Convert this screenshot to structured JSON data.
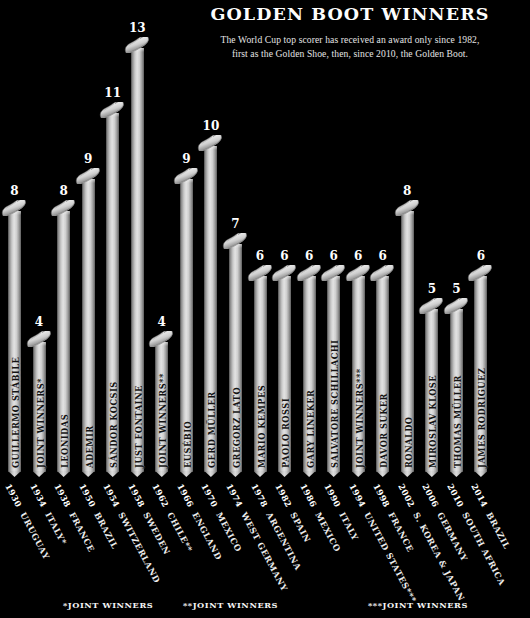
{
  "header": {
    "title": "GOLDEN BOOT WINNERS",
    "subtitle_line1": "The World Cup top scorer has received an award only since 1982,",
    "subtitle_line2": "first as the Golden Shoe, then, since 2010, the Golden Boot."
  },
  "footnotes": [
    {
      "label": "*JOINT WINNERS"
    },
    {
      "label": "**JOINT WINNERS"
    },
    {
      "label": "***JOINT WINNERS"
    }
  ],
  "colors": {
    "background": "#000000",
    "bar_light": "#e3e3e3",
    "bar_mid": "#9a9a9a",
    "bar_dark": "#4d4d4d",
    "text": "#ffffff",
    "bar_label_text": "#141414"
  },
  "chart_data": {
    "type": "bar",
    "title": "GOLDEN BOOT WINNERS",
    "subtitle": "The World Cup top scorer has received an award only since 1982, first as the Golden Shoe, then, since 2010, the Golden Boot.",
    "xlabel": "",
    "ylabel": "Goals",
    "ylim": [
      0,
      13
    ],
    "grid": false,
    "legend": "none",
    "categories": [
      "1930",
      "1934",
      "1938",
      "1950",
      "1954",
      "1958",
      "1962",
      "1966",
      "1970",
      "1974",
      "1978",
      "1982",
      "1986",
      "1990",
      "1994",
      "1998",
      "2002",
      "2006",
      "2010",
      "2014"
    ],
    "values": [
      8,
      4,
      8,
      9,
      11,
      13,
      4,
      9,
      10,
      7,
      6,
      6,
      6,
      6,
      6,
      6,
      8,
      5,
      5,
      6
    ],
    "bars": [
      {
        "year": "1930",
        "host": "URUGUAY",
        "scorer": "GUILLERMO STÁBILE",
        "goals": 8
      },
      {
        "year": "1934",
        "host": "ITALY*",
        "scorer": "JOINT WINNERS*",
        "goals": 4
      },
      {
        "year": "1938",
        "host": "FRANCE",
        "scorer": "LEONIDAS",
        "goals": 8
      },
      {
        "year": "1950",
        "host": "BRAZIL",
        "scorer": "ADEMIR",
        "goals": 9
      },
      {
        "year": "1954",
        "host": "SWITZERLAND",
        "scorer": "SÁNDOR KOCSIS",
        "goals": 11
      },
      {
        "year": "1958",
        "host": "SWEDEN",
        "scorer": "JUST FONTAINE",
        "goals": 13
      },
      {
        "year": "1962",
        "host": "CHILE**",
        "scorer": "JOINT WINNERS**",
        "goals": 4
      },
      {
        "year": "1966",
        "host": "ENGLAND",
        "scorer": "EUSÉBIO",
        "goals": 9
      },
      {
        "year": "1970",
        "host": "MEXICO",
        "scorer": "GERD MÜLLER",
        "goals": 10
      },
      {
        "year": "1974",
        "host": "WEST GERMANY",
        "scorer": "GREGORZ LATO",
        "goals": 7
      },
      {
        "year": "1978",
        "host": "ARGENTINA",
        "scorer": "MARIO KEMPES",
        "goals": 6
      },
      {
        "year": "1982",
        "host": "SPAIN",
        "scorer": "PAOLO ROSSI",
        "goals": 6
      },
      {
        "year": "1986",
        "host": "MEXICO",
        "scorer": "GARY LINEKER",
        "goals": 6
      },
      {
        "year": "1990",
        "host": "ITALY",
        "scorer": "SALVATORE SCHILLACHI",
        "goals": 6
      },
      {
        "year": "1994",
        "host": "UNITED STATES***",
        "scorer": "JOINT WINNERS***",
        "goals": 6
      },
      {
        "year": "1998",
        "host": "FRANCE",
        "scorer": "DAVOR SUKER",
        "goals": 6
      },
      {
        "year": "2002",
        "host": "S. KOREA & JAPAN",
        "scorer": "RONALDO",
        "goals": 8
      },
      {
        "year": "2006",
        "host": "GERMANY",
        "scorer": "MIROSLAV KLOSE",
        "goals": 5
      },
      {
        "year": "2010",
        "host": "SOUTH AFRICA",
        "scorer": "THOMAS MÜLLER",
        "goals": 5
      },
      {
        "year": "2014",
        "host": "BRAZIL",
        "scorer": "JAMES RODRIGUEZ",
        "goals": 6
      }
    ]
  }
}
